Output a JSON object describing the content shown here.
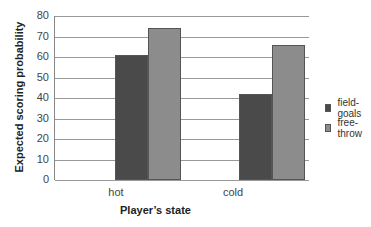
{
  "chart_data": {
    "type": "bar",
    "title": "",
    "xlabel": "Player’s state",
    "ylabel": "Expected scoring probability",
    "categories": [
      "hot",
      "cold"
    ],
    "series": [
      {
        "name": "field-goals",
        "values": [
          61,
          42
        ],
        "color": "#4a4a4a"
      },
      {
        "name": "free-throw",
        "values": [
          74,
          66
        ],
        "color": "#8c8c8c"
      }
    ],
    "ylim": [
      0,
      80
    ],
    "yticks": [
      0,
      10,
      20,
      30,
      40,
      50,
      60,
      70,
      80
    ],
    "grid": true,
    "legend_position": "right"
  }
}
